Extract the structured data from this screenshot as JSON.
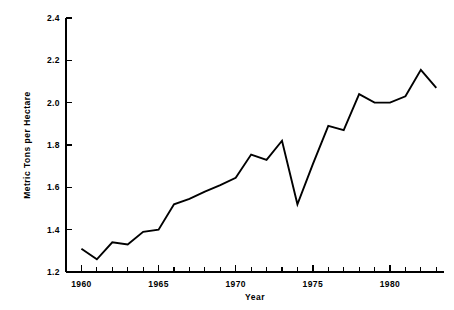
{
  "chart_data": {
    "type": "line",
    "title": "",
    "subtitle": "",
    "xlabel": "Year",
    "ylabel": "Metric Tons per Hectare",
    "x": [
      1960,
      1961,
      1962,
      1963,
      1964,
      1965,
      1966,
      1967,
      1968,
      1969,
      1970,
      1971,
      1972,
      1973,
      1974,
      1975,
      1976,
      1977,
      1978,
      1979,
      1980,
      1981,
      1982,
      1983
    ],
    "values": [
      1.31,
      1.26,
      1.34,
      1.33,
      1.39,
      1.4,
      1.52,
      1.545,
      1.58,
      1.61,
      1.645,
      1.755,
      1.73,
      1.82,
      1.52,
      1.71,
      1.89,
      1.87,
      2.04,
      2.0,
      2.0,
      2.03,
      2.155,
      2.07
    ],
    "series": [
      {
        "name": "yield",
        "values": [
          1.31,
          1.26,
          1.34,
          1.33,
          1.39,
          1.4,
          1.52,
          1.545,
          1.58,
          1.61,
          1.645,
          1.755,
          1.73,
          1.82,
          1.52,
          1.71,
          1.89,
          1.87,
          2.04,
          2.0,
          2.0,
          2.03,
          2.155,
          2.07
        ],
        "color": "#000000"
      }
    ],
    "xlim": [
      1959,
      1983.5
    ],
    "ylim": [
      1.2,
      2.4
    ],
    "ytick_labels": [
      "2.4",
      "2.2",
      "2.0",
      "1.8",
      "1.6",
      "1.4",
      "1.2"
    ],
    "ytick_values": [
      2.4,
      2.2,
      2.0,
      1.8,
      1.6,
      1.4,
      1.2
    ],
    "xtick_labels": [
      "1960",
      "1965",
      "1970",
      "1975",
      "1980"
    ],
    "xtick_values": [
      1960,
      1965,
      1970,
      1975,
      1980
    ],
    "xtick_minor_values": [
      1959,
      1961,
      1962,
      1963,
      1964,
      1966,
      1967,
      1968,
      1969,
      1971,
      1972,
      1973,
      1974,
      1976,
      1977,
      1978,
      1979,
      1981,
      1982,
      1983
    ],
    "grid": false,
    "legend": false,
    "legend_position": "none",
    "line_color": "#000000",
    "axis_color": "#000000",
    "background_color": "#ffffff"
  }
}
